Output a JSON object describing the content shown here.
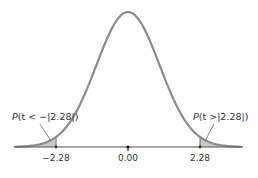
{
  "chart_data": {
    "type": "area",
    "title": "",
    "xlabel": "",
    "ylabel": "",
    "x_ticks": [
      -2.28,
      0.0,
      2.28
    ],
    "x_tick_labels": [
      "-2.28",
      "0.00",
      "2.28"
    ],
    "xlim": [
      -3.6,
      3.6
    ],
    "grid": false,
    "legend": null,
    "critical_value": 2.28,
    "annotations": [
      {
        "label": "P(t < -|2.28|)",
        "target": "left-tail",
        "x": -2.6
      },
      {
        "label": "P(t >|2.28|)",
        "target": "right-tail",
        "x": 2.6
      }
    ],
    "shaded_regions": [
      {
        "from": -3.6,
        "to": -2.28,
        "label": "left-tail"
      },
      {
        "from": 2.28,
        "to": 3.6,
        "label": "right-tail"
      }
    ],
    "colors": {
      "curve": "#8c8c8c",
      "shade": "#c8c8c8",
      "axis": "#555555",
      "text": "#333333"
    }
  },
  "labels": {
    "tick_left": "−2.28",
    "tick_center": "0.00",
    "tick_right": "2.28",
    "annot_left_p": "P",
    "annot_left_rest": "(t < −|2.28|)",
    "annot_right_p": "P",
    "annot_right_rest": "(t >|2.28|)"
  }
}
